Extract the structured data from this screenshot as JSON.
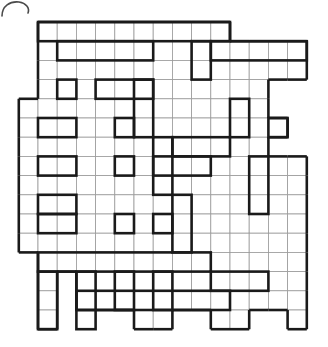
{
  "document": {
    "type": "crossword-grid",
    "title": "Fill-In Crossword Puzzle Grid",
    "description": "Blank kriss-kross style crossword grid with irregular outline",
    "page_artifact": "corner-arc-scan-mark"
  },
  "colors": {
    "background": "#ffffff",
    "cell_fill": "#ffffff",
    "cell_border": "#9a9a9a",
    "entry_border": "#1a1a1a",
    "artifact": "#4a4a4a"
  },
  "grid": {
    "origin_x": 38,
    "origin_y": 22,
    "cell_size": 19.2,
    "columns": 15,
    "rows": 16,
    "column_offset": -1,
    "cells_filled": 0,
    "clue_numbers": [],
    "letters": []
  },
  "grid_data": {
    "type": "table",
    "note": "Each row lists the column indices (relative to origin column 0) that contain an open cell.",
    "rows": [
      {
        "r": 0,
        "cols": [
          0,
          1,
          2,
          3,
          4,
          5,
          6,
          7,
          8,
          9
        ]
      },
      {
        "r": 1,
        "cols": [
          0,
          1,
          2,
          3,
          4,
          5,
          6,
          7,
          8,
          9,
          10,
          11,
          12,
          13
        ]
      },
      {
        "r": 2,
        "cols": [
          0,
          1,
          2,
          3,
          4,
          5,
          6,
          7,
          8,
          9,
          10,
          11,
          12,
          13
        ]
      },
      {
        "r": 3,
        "cols": [
          0,
          1,
          2,
          3,
          4,
          5,
          6,
          7,
          8,
          9,
          10,
          11
        ]
      },
      {
        "r": 4,
        "cols": [
          -1,
          0,
          1,
          2,
          3,
          4,
          5,
          6,
          7,
          8,
          9,
          10,
          11
        ]
      },
      {
        "r": 5,
        "cols": [
          -1,
          0,
          1,
          2,
          3,
          4,
          5,
          6,
          7,
          8,
          9,
          10,
          11,
          12
        ]
      },
      {
        "r": 6,
        "cols": [
          -1,
          0,
          1,
          2,
          3,
          4,
          5,
          6,
          7,
          8,
          9,
          10,
          11
        ]
      },
      {
        "r": 7,
        "cols": [
          -1,
          0,
          1,
          2,
          3,
          4,
          5,
          6,
          7,
          8,
          9,
          10,
          11,
          12,
          13
        ]
      },
      {
        "r": 8,
        "cols": [
          -1,
          0,
          1,
          2,
          3,
          4,
          5,
          6,
          7,
          8,
          9,
          10,
          11,
          12,
          13
        ]
      },
      {
        "r": 9,
        "cols": [
          -1,
          0,
          1,
          2,
          3,
          4,
          5,
          6,
          7,
          8,
          9,
          10,
          11,
          12,
          13
        ]
      },
      {
        "r": 10,
        "cols": [
          -1,
          0,
          1,
          2,
          3,
          4,
          5,
          6,
          7,
          8,
          9,
          10,
          11,
          12,
          13
        ]
      },
      {
        "r": 11,
        "cols": [
          -1,
          0,
          1,
          2,
          3,
          4,
          5,
          6,
          7,
          8,
          9,
          10,
          11,
          12,
          13
        ]
      },
      {
        "r": 12,
        "cols": [
          0,
          1,
          2,
          3,
          4,
          5,
          6,
          7,
          8,
          9,
          10,
          11,
          12,
          13
        ]
      },
      {
        "r": 13,
        "cols": [
          0,
          2,
          3,
          4,
          5,
          6,
          7,
          8,
          9,
          10,
          11,
          12,
          13
        ]
      },
      {
        "r": 14,
        "cols": [
          0,
          2,
          3,
          4,
          5,
          6,
          7,
          8,
          9,
          10,
          11,
          12,
          13
        ]
      },
      {
        "r": 15,
        "cols": [
          0,
          5,
          6,
          9,
          10,
          13
        ]
      }
    ],
    "entries_across": [
      {
        "r": 0,
        "c0": 0,
        "len": 10
      },
      {
        "r": 1,
        "c0": 1,
        "len": 5
      },
      {
        "r": 1,
        "c0": 9,
        "len": 5
      },
      {
        "r": 3,
        "c0": 1,
        "len": 1
      },
      {
        "r": 3,
        "c0": 3,
        "len": 3
      },
      {
        "r": 5,
        "c0": 0,
        "len": 2
      },
      {
        "r": 5,
        "c0": 4,
        "len": 1
      },
      {
        "r": 5,
        "c0": 12,
        "len": 1
      },
      {
        "r": 6,
        "c0": 7,
        "len": 3
      },
      {
        "r": 7,
        "c0": 0,
        "len": 2
      },
      {
        "r": 7,
        "c0": 4,
        "len": 1
      },
      {
        "r": 7,
        "c0": 6,
        "len": 3
      },
      {
        "r": 9,
        "c0": 0,
        "len": 2
      },
      {
        "r": 10,
        "c0": 0,
        "len": 2
      },
      {
        "r": 10,
        "c0": 4,
        "len": 1
      },
      {
        "r": 10,
        "c0": 6,
        "len": 1
      },
      {
        "r": 12,
        "c0": 0,
        "len": 9
      },
      {
        "r": 13,
        "c0": 9,
        "len": 3
      },
      {
        "r": 14,
        "c0": 2,
        "len": 8
      }
    ],
    "entries_down": [
      {
        "c": 8,
        "r0": 1,
        "len": 2
      },
      {
        "c": 5,
        "r0": 3,
        "len": 3
      },
      {
        "c": 10,
        "r0": 4,
        "len": 2
      },
      {
        "c": 6,
        "r0": 6,
        "len": 3
      },
      {
        "c": 11,
        "r0": 7,
        "len": 3
      },
      {
        "c": 7,
        "r0": 9,
        "len": 3
      },
      {
        "c": 2,
        "r0": 13,
        "len": 3
      },
      {
        "c": 4,
        "r0": 13,
        "len": 2
      },
      {
        "c": 6,
        "r0": 13,
        "len": 2
      },
      {
        "c": 0,
        "r0": 13,
        "len": 3
      }
    ]
  }
}
